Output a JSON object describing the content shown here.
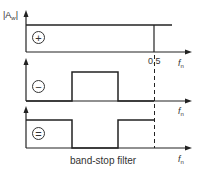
{
  "diagram": {
    "y_axis_label": "|A_w|",
    "y_axis_label_main": "|A",
    "y_axis_label_sub": "w",
    "x_axis_label_main": "f",
    "x_axis_label_sub": "n",
    "tick_label": "0.5",
    "caption": "band-stop filter",
    "panels": [
      {
        "symbol": "+",
        "description": "low-pass response: flat magnitude from 0 to 0.5"
      },
      {
        "symbol": "−",
        "description": "band-pass response: rectangular passband in middle"
      },
      {
        "symbol": "=",
        "description": "band-stop response: difference, notch in middle"
      }
    ],
    "line_color": "#222222"
  }
}
